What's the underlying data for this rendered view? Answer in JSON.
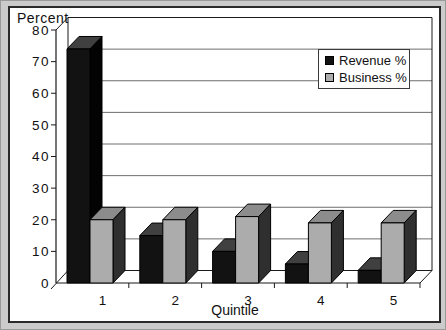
{
  "page": {
    "background_color": "#cbcbcb",
    "chart_frame_color": "#2a2a2a"
  },
  "chart": {
    "axis_label_top": "Percent",
    "xlabel": "Quintile",
    "legend": {
      "position": "top-right",
      "items": [
        {
          "label": "Revenue %",
          "color": "#121212"
        },
        {
          "label": "Business %",
          "color": "#acacac"
        }
      ]
    }
  },
  "chart_data": {
    "type": "bar",
    "subtype": "3d-clustered",
    "title": "",
    "xlabel": "Quintile",
    "ylabel": "Percent",
    "categories": [
      "1",
      "2",
      "3",
      "4",
      "5"
    ],
    "series": [
      {
        "name": "Revenue %",
        "values": [
          74,
          15,
          10,
          6,
          4
        ],
        "color_front": "#121212",
        "color_top": "#404040",
        "color_side": "#030303"
      },
      {
        "name": "Business %",
        "values": [
          20,
          20,
          21,
          19,
          19
        ],
        "color_front": "#acacac",
        "color_top": "#8c8c8c",
        "color_side": "#2f2f2f"
      }
    ],
    "ylim": [
      0,
      80
    ],
    "yticks": [
      0,
      10,
      20,
      30,
      40,
      50,
      60,
      70,
      80
    ],
    "grid": true,
    "gridline_color": "#6e6e6e",
    "axis_color": "#1a1a1a",
    "legend_position": "top-right"
  }
}
